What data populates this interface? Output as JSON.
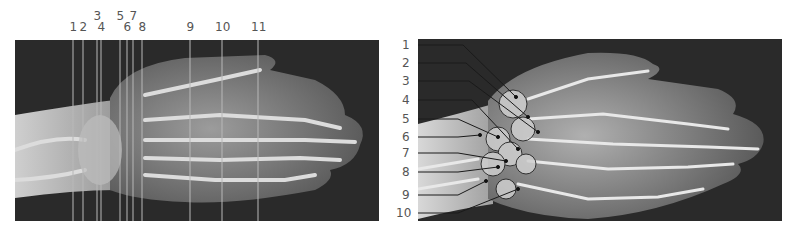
{
  "figure": {
    "left_panel": {
      "description": "X-ray of hand, dorsal view, with numbered vertical section lines",
      "section_labels": [
        "1",
        "2",
        "3",
        "4",
        "5",
        "6",
        "7",
        "8",
        "9",
        "10",
        "11"
      ]
    },
    "right_panel": {
      "description": "Annotated X-ray of hand with numbered leader lines to carpal bones",
      "pointer_labels": [
        "1",
        "2",
        "3",
        "4",
        "5",
        "6",
        "7",
        "8",
        "9",
        "10"
      ]
    },
    "colors": {
      "background": "#2a2a2a",
      "bone": "#e0e0e0",
      "soft_tissue": "#8a8a8a",
      "line": "#b8b8b8",
      "label": "#555555"
    }
  }
}
